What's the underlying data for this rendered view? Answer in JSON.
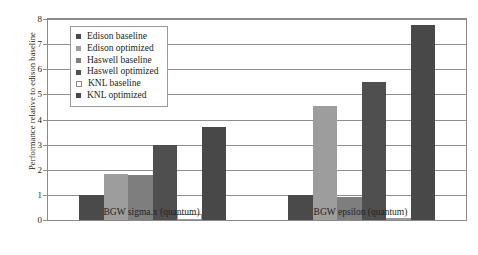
{
  "chart_data": {
    "type": "bar",
    "title": "",
    "xlabel": "",
    "ylabel": "Performance relative to edison baseline",
    "categories": [
      "BGW sigma.x (quantum)",
      "BGW epsilon (quantum)"
    ],
    "ylim": [
      0,
      8
    ],
    "yticks": [
      0,
      1,
      2,
      3,
      4,
      5,
      6,
      7,
      8
    ],
    "ytick_labels": [
      "0",
      "1",
      "2",
      "3",
      "4",
      "5",
      "6",
      "7",
      "8"
    ],
    "grid": true,
    "legend_position": "upper-left-inside",
    "series": [
      {
        "name": "Edison baseline",
        "values": [
          1.0,
          1.0
        ],
        "color": "#4a4a4a"
      },
      {
        "name": "Edison optimized",
        "values": [
          1.85,
          4.55
        ],
        "color": "#9d9d9d"
      },
      {
        "name": "Haswell baseline",
        "values": [
          1.8,
          0.9
        ],
        "color": "#7e7e7e"
      },
      {
        "name": "Haswell optimized",
        "values": [
          3.0,
          5.5
        ],
        "color": "#4f4f4f"
      },
      {
        "name": "KNL baseline",
        "values": [
          0.25,
          0.06
        ],
        "color": "#ffffff"
      },
      {
        "name": "KNL optimized",
        "values": [
          3.7,
          7.75
        ],
        "color": "#484848"
      }
    ]
  },
  "legend": {
    "items": [
      {
        "label": "Edison baseline"
      },
      {
        "label": "Edison optimized"
      },
      {
        "label": "Haswell baseline"
      },
      {
        "label": "Haswell optimized"
      },
      {
        "label": "KNL baseline"
      },
      {
        "label": "KNL optimized"
      }
    ]
  }
}
